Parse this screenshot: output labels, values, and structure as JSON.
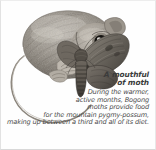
{
  "figure": {
    "alt_description": "Pencil illustration of a mountain pygmy-possum eating a Bogong moth",
    "subject_icon": "possum-icon",
    "secondary_icon": "moth-icon",
    "ink_color": "#5a5650",
    "background_color": "#fefefe",
    "border_color": "#e2e2e2"
  },
  "caption": {
    "title": "A mouthful\nof moth",
    "title_line_1": "A mouthful",
    "title_line_2": "of moth",
    "body": "During the warmer,\nactive months, Bogong\nmoths provide food\nfor the mountain pygmy-possum,\nmaking up between a third and all of its diet.",
    "body_lines": [
      "During the warmer,",
      "active months, Bogong",
      "moths provide food",
      "for the mountain pygmy-possum,",
      "making up between a third and all of its diet."
    ],
    "text_color": "#4a4a4a",
    "title_color": "#3b3b3b"
  }
}
